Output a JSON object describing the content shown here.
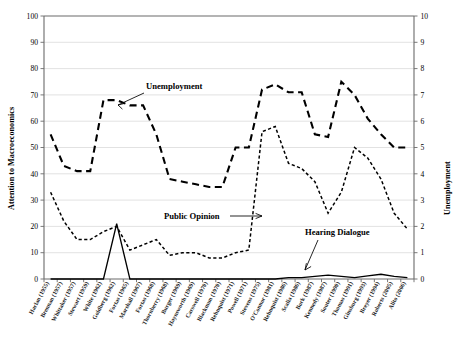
{
  "chart_data": {
    "type": "line",
    "title": "",
    "xlabel": "",
    "ylabel": "Attention to Macroeconomics",
    "y2label": "Unemployment",
    "ylim": [
      0,
      100
    ],
    "y2lim": [
      0,
      10
    ],
    "grid": true,
    "legend_position": "inline-annotations",
    "yticks": [
      "0",
      "10",
      "20",
      "30",
      "40",
      "50",
      "60",
      "70",
      "80",
      "90",
      "100"
    ],
    "y2ticks": [
      "0",
      "1",
      "2",
      "3",
      "4",
      "5",
      "6",
      "7",
      "8",
      "9",
      "10"
    ],
    "categories": [
      "Harlan (1955)",
      "Brennan (1957)",
      "Whittaker (1957)",
      "Stewart (1959)",
      "White (1962)",
      "Goldberg (1962)",
      "Fortas (1965)",
      "Marshall (1967)",
      "Fortas (1968)",
      "Thornberry (1968)",
      "Burger (1969)",
      "Haynsworth (1969)",
      "Carswell (1970)",
      "Blackmun (1970)",
      "Rehnquist (1971)",
      "Powell (1971)",
      "Stevens (1975)",
      "O'Connor (1981)",
      "Rehnquist (1986)",
      "Scalia (1986)",
      "Bork (1987)",
      "Kennedy (1987)",
      "Souter (1990)",
      "Thomas (1991)",
      "Ginsburg (1993)",
      "Breyer (1994)",
      "Roberts (2005)",
      "Alito (2006)"
    ],
    "series": [
      {
        "name": "Unemployment",
        "axis": "right",
        "unit": "percent",
        "values": [
          5.5,
          4.3,
          4.1,
          4.1,
          6.8,
          6.8,
          6.6,
          6.6,
          5.5,
          3.8,
          3.7,
          3.6,
          3.5,
          3.5,
          5.0,
          5.0,
          7.2,
          7.4,
          7.1,
          7.1,
          5.5,
          5.4,
          7.5,
          7.0,
          6.1,
          5.5,
          5.0,
          5.0
        ]
      },
      {
        "name": "Public Opinion",
        "axis": "left",
        "unit": "percent-most-important-problem",
        "values": [
          33,
          22,
          15,
          15,
          18,
          20,
          11,
          13,
          15,
          9,
          10,
          10,
          8,
          8,
          10,
          11,
          56,
          58,
          44,
          42,
          37,
          25,
          33,
          50,
          46,
          38,
          25,
          19
        ]
      },
      {
        "name": "Hearing Dialogue",
        "axis": "left",
        "unit": "percent-of-hearing-dialogue",
        "values": [
          0,
          0,
          0,
          0,
          0,
          21,
          0,
          0,
          0,
          0,
          0,
          0,
          0,
          0,
          0,
          0,
          0,
          0,
          0.5,
          0.5,
          1.0,
          1.5,
          1.0,
          0.5,
          1.2,
          1.8,
          1.0,
          0.5
        ]
      }
    ],
    "annotations": [
      {
        "label": "Unemployment",
        "target": "series-unemployment"
      },
      {
        "label": "Public Opinion",
        "target": "series-public"
      },
      {
        "label": "Hearing Dialogue",
        "target": "series-hearing"
      }
    ]
  }
}
